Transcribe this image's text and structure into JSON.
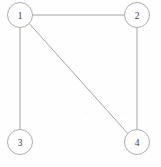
{
  "figure": {
    "kind": "undirected-graph-diagram",
    "width": 161,
    "height": 167,
    "background_color": "#fefefe",
    "stroke_color": "#9b9b9b",
    "node_fill_color": "#ffffff",
    "label_color": "#3a3a3a"
  },
  "graph": {
    "node_radius": 12.5,
    "nodes": [
      {
        "id": "1",
        "label": "1",
        "x": 20,
        "y": 15
      },
      {
        "id": "2",
        "label": "2",
        "x": 137,
        "y": 15
      },
      {
        "id": "3",
        "label": "3",
        "x": 20,
        "y": 142
      },
      {
        "id": "4",
        "label": "4",
        "x": 137,
        "y": 142
      }
    ],
    "edges": [
      {
        "id": "1-2",
        "from": "1",
        "to": "2",
        "orientation": "horizontal"
      },
      {
        "id": "1-3",
        "from": "1",
        "to": "3",
        "orientation": "vertical"
      },
      {
        "id": "2-4",
        "from": "2",
        "to": "4",
        "orientation": "vertical"
      },
      {
        "id": "1-4",
        "from": "1",
        "to": "4",
        "orientation": "diagonal"
      }
    ]
  }
}
